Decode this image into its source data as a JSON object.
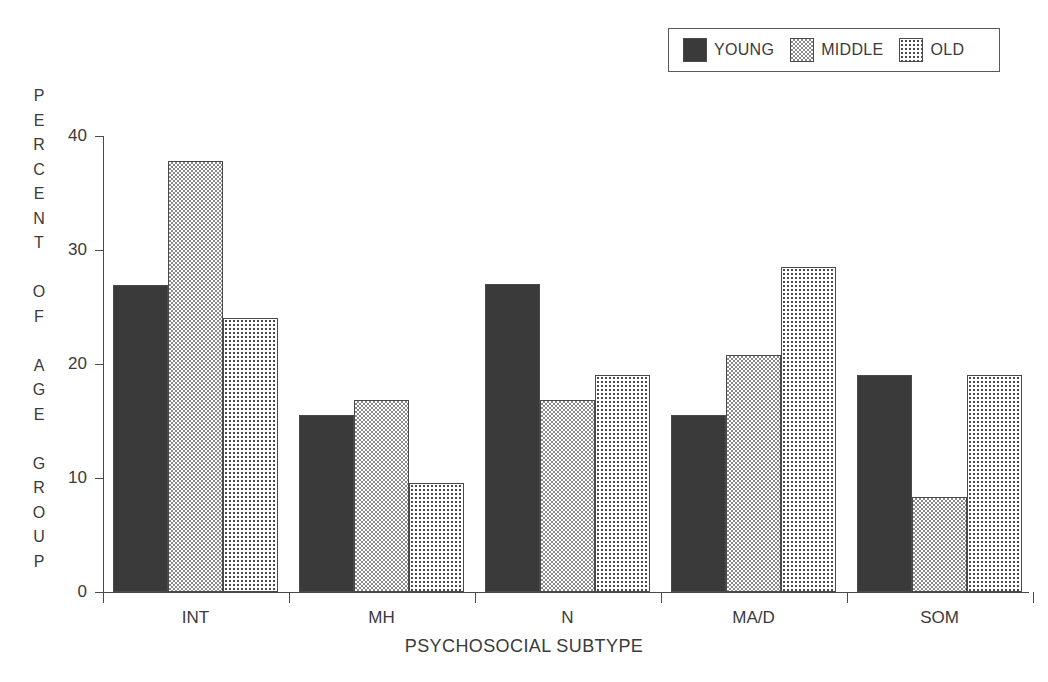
{
  "chart_data": {
    "type": "bar",
    "title": "",
    "xlabel": "PSYCHOSOCIAL SUBTYPE",
    "ylabel": "PERCENT OF AGE GROUP",
    "categories": [
      "INT",
      "MH",
      "N",
      "MA/D",
      "SOM"
    ],
    "series": [
      {
        "name": "YOUNG",
        "values": [
          26.9,
          15.5,
          27.0,
          15.5,
          19.0
        ],
        "pattern": "solid-dark",
        "color": "#3a3a3a"
      },
      {
        "name": "MIDDLE",
        "values": [
          37.8,
          16.8,
          16.8,
          20.8,
          8.3
        ],
        "pattern": "checkerboard",
        "color": "#8a8a8a"
      },
      {
        "name": "OLD",
        "values": [
          24.0,
          9.6,
          19.0,
          28.5,
          19.0
        ],
        "pattern": "dotted",
        "color": "#4a4a4a"
      }
    ],
    "ylim": [
      0,
      40
    ],
    "yticks": [
      0,
      10,
      20,
      30,
      40
    ],
    "ytick_labels": [
      "0",
      "10",
      "20",
      "30",
      "40"
    ],
    "grid": false,
    "legend_position": "top-right"
  },
  "ylabel_letters": [
    "P",
    "E",
    "R",
    "C",
    "E",
    "N",
    "T",
    "",
    "O",
    "F",
    "",
    "A",
    "G",
    "E",
    "",
    "G",
    "R",
    "O",
    "U",
    "P"
  ],
  "legend": {
    "entries": [
      {
        "label": "YOUNG",
        "swatch": "swatch-young"
      },
      {
        "label": "MIDDLE",
        "swatch": "swatch-middle"
      },
      {
        "label": "OLD",
        "swatch": "swatch-old"
      }
    ]
  }
}
